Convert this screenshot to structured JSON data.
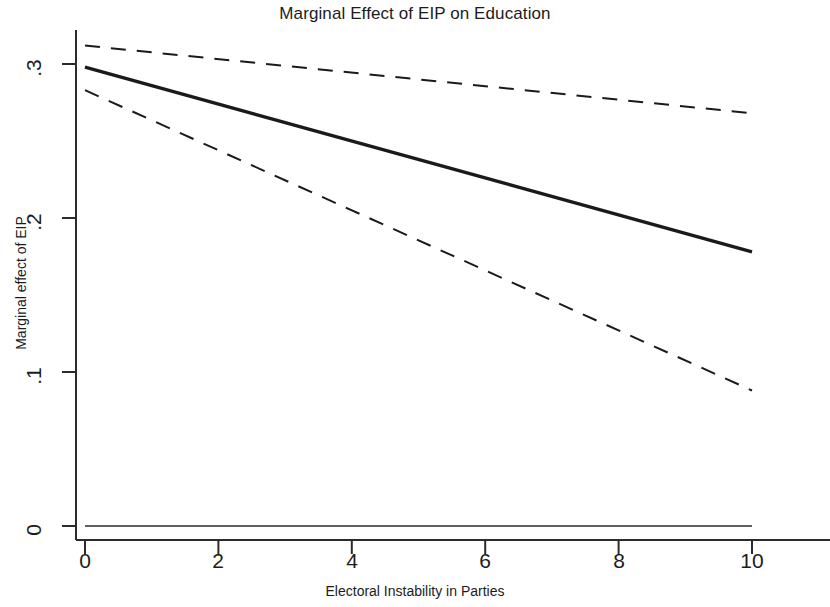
{
  "chart_data": {
    "type": "line",
    "title": "Marginal Effect of EIP on Education",
    "xlabel": "Electoral Instability in Parties",
    "ylabel": "Marginal effect of EIP",
    "xlim": [
      0,
      10
    ],
    "ylim": [
      0,
      0.32
    ],
    "grid": false,
    "legend": null,
    "xticks": [
      0,
      2,
      4,
      6,
      8,
      10
    ],
    "xtick_labels": [
      "0",
      "2",
      "4",
      "6",
      "8",
      "10"
    ],
    "yticks": [
      0,
      0.1,
      0.2,
      0.3
    ],
    "ytick_labels": [
      "0",
      ".1",
      ".2",
      ".3"
    ],
    "x": [
      0,
      10
    ],
    "series": [
      {
        "name": "Marginal effect",
        "style": "solid",
        "color": "#1a1a1a",
        "width": 3.4,
        "values": [
          0.298,
          0.178
        ]
      },
      {
        "name": "Upper 95% confidence bound",
        "style": "dashed",
        "color": "#1a1a1a",
        "width": 2.0,
        "values": [
          0.312,
          0.268
        ]
      },
      {
        "name": "Lower 95% confidence bound",
        "style": "dashed",
        "color": "#1a1a1a",
        "width": 2.0,
        "values": [
          0.283,
          0.088
        ]
      },
      {
        "name": "Zero reference line",
        "style": "solid",
        "color": "#2b2b2b",
        "width": 1.6,
        "values": [
          0.0,
          0.0
        ]
      }
    ],
    "annotations": []
  },
  "axis": {
    "x_tick_0": "0",
    "x_tick_1": "2",
    "x_tick_2": "4",
    "x_tick_3": "6",
    "x_tick_4": "8",
    "x_tick_5": "10",
    "y_tick_0": "0",
    "y_tick_1": ".1",
    "y_tick_2": ".2",
    "y_tick_3": ".3"
  }
}
